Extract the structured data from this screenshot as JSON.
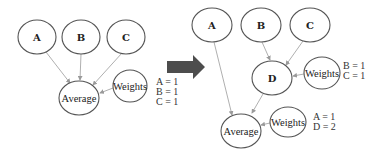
{
  "diagram": {
    "left": {
      "nodes": {
        "a": "A",
        "b": "B",
        "c": "C",
        "average": "Average",
        "weights": "Weights"
      },
      "weights_values": [
        "A = 1",
        "B = 1",
        "C = 1"
      ]
    },
    "transition_arrow": "right-arrow-icon",
    "right": {
      "nodes": {
        "a": "A",
        "b": "B",
        "c": "C",
        "d": "D",
        "average": "Average",
        "weights_d": "Weights",
        "weights_average": "Weights"
      },
      "weights_d_values": [
        "B = 1",
        "C = 1"
      ],
      "weights_average_values": [
        "A = 1",
        "D = 2"
      ]
    },
    "colors": {
      "node_stroke": "#555555",
      "edge": "#9a9a9a",
      "arrow": "#4d4d4d"
    }
  }
}
